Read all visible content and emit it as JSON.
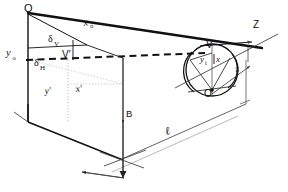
{
  "figure": {
    "background_color": "#ffffff",
    "ink_color": "#111111",
    "thin_color": "#555555",
    "faint_color": "#999999"
  },
  "points": [
    {
      "id": "Q",
      "label": "Q",
      "x": 28,
      "y": 10,
      "desc": "object-top-point"
    },
    {
      "id": "Vp",
      "label": "V′",
      "x": 73,
      "y": 52,
      "desc": "vanishing-point-on-object-plane"
    },
    {
      "id": "B",
      "label": "B",
      "x": 123,
      "y": 116,
      "desc": "base-point"
    },
    {
      "id": "V",
      "label": "V",
      "x": 216,
      "y": 44,
      "desc": "image-vertex"
    },
    {
      "id": "O",
      "label": "O",
      "x": 212,
      "y": 90,
      "desc": "eye-center"
    },
    {
      "id": "Z",
      "label": "Z",
      "x": 258,
      "y": 30,
      "desc": "optical-axis-label"
    }
  ],
  "labels": [
    {
      "id": "x_o",
      "base": "x",
      "sub": "o",
      "style": "italic",
      "x": 88,
      "y": 30,
      "rot": -12,
      "desc": "object-horizontal-extent"
    },
    {
      "id": "y_o",
      "base": "y",
      "sub": "o",
      "style": "italic",
      "x": 10,
      "y": 57,
      "rot": 0,
      "desc": "object-vertical-extent"
    },
    {
      "id": "delta_V",
      "base": "δ",
      "sub": "V",
      "style": "greek",
      "x": 52,
      "y": 40,
      "rot": 0,
      "desc": "vertical-offset"
    },
    {
      "id": "delta_H",
      "base": "δ",
      "sub": "H",
      "style": "greek",
      "x": 40,
      "y": 62,
      "rot": 0,
      "desc": "horizontal-offset"
    },
    {
      "id": "x_prime",
      "base": "x′",
      "sub": "",
      "style": "italic",
      "x": 78,
      "y": 90,
      "rot": -8,
      "desc": "projected-x-on-ground"
    },
    {
      "id": "y_prime",
      "base": "y′",
      "sub": "",
      "style": "italic",
      "x": 48,
      "y": 92,
      "rot": -8,
      "desc": "projected-y-on-ground"
    },
    {
      "id": "y_i",
      "base": "y",
      "sub": "i",
      "style": "italic",
      "x": 206,
      "y": 60,
      "rot": 0,
      "desc": "image-height"
    },
    {
      "id": "x_i",
      "base": "x",
      "sub": "",
      "style": "italic",
      "x": 219,
      "y": 60,
      "rot": 0,
      "desc": "image-width"
    },
    {
      "id": "ell",
      "base": "ℓ",
      "sub": "",
      "style": "italic",
      "x": 168,
      "y": 133,
      "rot": -14,
      "desc": "distance-to-object-plane"
    },
    {
      "id": "z_small",
      "base": "z",
      "sub": "",
      "style": "italic",
      "x": 239,
      "y": 70,
      "rot": -14,
      "desc": "image-distance"
    }
  ],
  "measurements": {
    "l_label": "ℓ",
    "z_label": "z",
    "axis_label": "Z"
  },
  "line_kinds": {
    "solid_thick": "object outline and sight ray",
    "dashed": "horizontal line of sight from V′ to eye",
    "dotted": "hidden construction lines on ground plane",
    "thin": "dimension, axis and leader lines"
  }
}
